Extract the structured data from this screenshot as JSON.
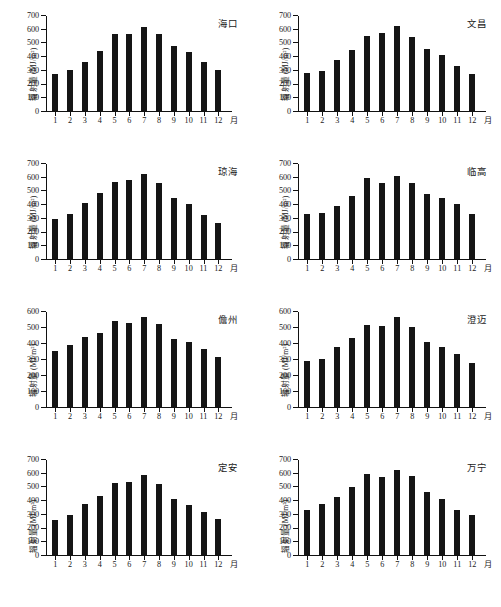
{
  "figure": {
    "y_axis_label": "辐射量 (MJ/m²)",
    "x_axis_unit": "月",
    "month_labels": [
      "1",
      "2",
      "3",
      "4",
      "5",
      "6",
      "7",
      "8",
      "9",
      "10",
      "11",
      "12"
    ],
    "bar_color": "#151515",
    "axis_color": "#111111",
    "background": "#ffffff"
  },
  "chart_data": [
    {
      "type": "bar",
      "title": "海口",
      "xlabel": "月",
      "ylabel": "辐射量 (MJ/m²)",
      "categories": [
        "1",
        "2",
        "3",
        "4",
        "5",
        "6",
        "7",
        "8",
        "9",
        "10",
        "11",
        "12"
      ],
      "values": [
        270,
        300,
        360,
        435,
        562,
        563,
        613,
        560,
        475,
        432,
        360,
        298
      ],
      "ylim": [
        0,
        700
      ],
      "yticks": [
        0,
        100,
        200,
        300,
        400,
        500,
        600,
        700
      ],
      "grid": false,
      "legend": false
    },
    {
      "type": "bar",
      "title": "文昌",
      "xlabel": "月",
      "ylabel": "辐射量 (MJ/m²)",
      "categories": [
        "1",
        "2",
        "3",
        "4",
        "5",
        "6",
        "7",
        "8",
        "9",
        "10",
        "11",
        "12"
      ],
      "values": [
        278,
        295,
        375,
        443,
        545,
        570,
        620,
        540,
        453,
        410,
        325,
        268
      ],
      "ylim": [
        0,
        700
      ],
      "yticks": [
        0,
        100,
        200,
        300,
        400,
        500,
        600,
        700
      ],
      "grid": false,
      "legend": false
    },
    {
      "type": "bar",
      "title": "琼海",
      "xlabel": "月",
      "ylabel": "辐射量 (MJ/m²)",
      "categories": [
        "1",
        "2",
        "3",
        "4",
        "5",
        "6",
        "7",
        "8",
        "9",
        "10",
        "11",
        "12"
      ],
      "values": [
        290,
        325,
        410,
        478,
        565,
        575,
        623,
        557,
        442,
        400,
        320,
        263
      ],
      "ylim": [
        0,
        700
      ],
      "yticks": [
        0,
        100,
        200,
        300,
        400,
        500,
        600,
        700
      ],
      "grid": false,
      "legend": false
    },
    {
      "type": "bar",
      "title": "临高",
      "xlabel": "月",
      "ylabel": "辐射量 (MJ/m²)",
      "categories": [
        "1",
        "2",
        "3",
        "4",
        "5",
        "6",
        "7",
        "8",
        "9",
        "10",
        "11",
        "12"
      ],
      "values": [
        325,
        338,
        388,
        463,
        590,
        552,
        605,
        553,
        475,
        448,
        400,
        330
      ],
      "ylim": [
        0,
        700
      ],
      "yticks": [
        0,
        100,
        200,
        300,
        400,
        500,
        600,
        700
      ],
      "grid": false,
      "legend": false
    },
    {
      "type": "bar",
      "title": "儋州",
      "xlabel": "月",
      "ylabel": "辐射量 (MJ/m²)",
      "categories": [
        "1",
        "2",
        "3",
        "4",
        "5",
        "6",
        "7",
        "8",
        "9",
        "10",
        "11",
        "12"
      ],
      "values": [
        350,
        388,
        435,
        465,
        538,
        527,
        565,
        518,
        425,
        405,
        365,
        310
      ],
      "ylim": [
        0,
        600
      ],
      "yticks": [
        0,
        100,
        200,
        300,
        400,
        500,
        600
      ],
      "grid": false,
      "legend": false
    },
    {
      "type": "bar",
      "title": "澄迈",
      "xlabel": "月",
      "ylabel": "辐射量 (MJ/m²)",
      "categories": [
        "1",
        "2",
        "3",
        "4",
        "5",
        "6",
        "7",
        "8",
        "9",
        "10",
        "11",
        "12"
      ],
      "values": [
        288,
        303,
        372,
        430,
        513,
        508,
        560,
        503,
        408,
        372,
        333,
        278
      ],
      "ylim": [
        0,
        600
      ],
      "yticks": [
        0,
        100,
        200,
        300,
        400,
        500,
        600
      ],
      "grid": false,
      "legend": false
    },
    {
      "type": "bar",
      "title": "定安",
      "xlabel": "月",
      "ylabel": "辐射量 (MJ/m²)",
      "categories": [
        "1",
        "2",
        "3",
        "4",
        "5",
        "6",
        "7",
        "8",
        "9",
        "10",
        "11",
        "12"
      ],
      "values": [
        258,
        295,
        375,
        432,
        525,
        530,
        585,
        518,
        412,
        367,
        315,
        260
      ],
      "ylim": [
        0,
        700
      ],
      "yticks": [
        0,
        100,
        200,
        300,
        400,
        500,
        600,
        700
      ],
      "grid": false,
      "legend": false
    },
    {
      "type": "bar",
      "title": "万宁",
      "xlabel": "月",
      "ylabel": "辐射量 (MJ/m²)",
      "categories": [
        "1",
        "2",
        "3",
        "4",
        "5",
        "6",
        "7",
        "8",
        "9",
        "10",
        "11",
        "12"
      ],
      "values": [
        328,
        373,
        425,
        498,
        592,
        568,
        622,
        573,
        458,
        408,
        330,
        295
      ],
      "ylim": [
        0,
        700
      ],
      "yticks": [
        0,
        100,
        200,
        300,
        400,
        500,
        600,
        700
      ],
      "grid": false,
      "legend": false
    }
  ]
}
